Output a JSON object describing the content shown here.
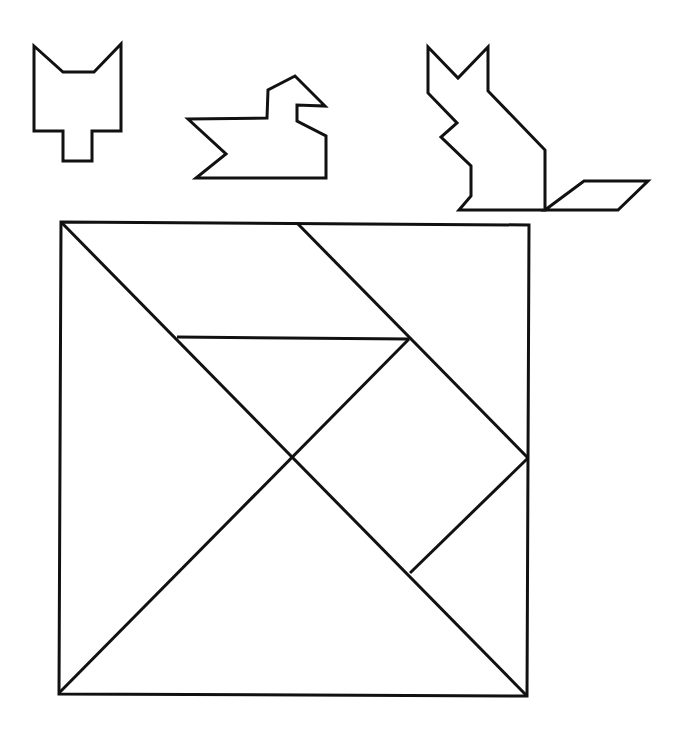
{
  "diagram": {
    "type": "tangram",
    "stroke_color": "#111111",
    "background_color": "#ffffff",
    "figures": [
      {
        "name": "cat-head",
        "points": "34,46 63,72 94,72 121,44 121,131 92,131 92,161 63,161 63,131 34,131"
      },
      {
        "name": "duck",
        "points": "188,119 267,118 268,90 295,76 325,106 297,105 297,121 326,136 326,178 196,178 226,154"
      },
      {
        "name": "sitting-cat",
        "points": "428,47 458,78 488,47 488,91 545,150 545,210 459,210 471,196 471,166 441,137 457,123 428,93"
      },
      {
        "name": "cat-tail",
        "points": "545,210 584,181 648,181 618,210"
      }
    ],
    "square": {
      "points": "61,222 529,225 527,696 59,694"
    },
    "lines": [
      {
        "name": "main-diagonal",
        "x1": 61,
        "y1": 222,
        "x2": 527,
        "y2": 696
      },
      {
        "name": "upper-parallelogram-edge",
        "x1": 297,
        "y1": 223,
        "x2": 528,
        "y2": 458
      },
      {
        "name": "horizontal-edge",
        "x1": 177,
        "y1": 337,
        "x2": 409,
        "y2": 339
      },
      {
        "name": "anti-diagonal",
        "x1": 409,
        "y1": 339,
        "x2": 59,
        "y2": 693
      },
      {
        "name": "square-piece-edge",
        "x1": 528,
        "y1": 458,
        "x2": 410,
        "y2": 573
      }
    ]
  }
}
